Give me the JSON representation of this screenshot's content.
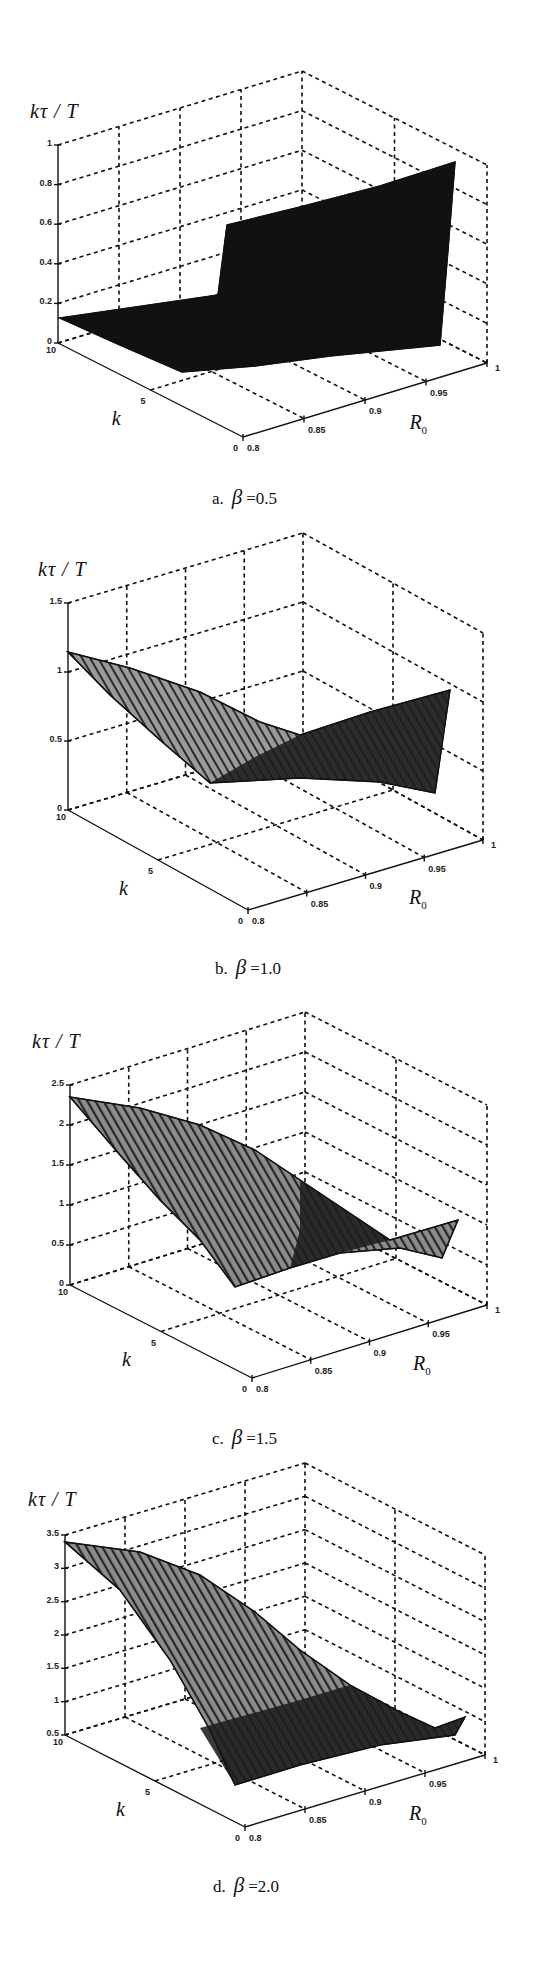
{
  "figure": {
    "panels": [
      {
        "id": "a",
        "caption_prefix": "a.",
        "beta_symbol": "β",
        "caption_value": "=0.5"
      },
      {
        "id": "b",
        "caption_prefix": "b.",
        "beta_symbol": "β",
        "caption_value": "=1.0"
      },
      {
        "id": "c",
        "caption_prefix": "c.",
        "beta_symbol": "β",
        "caption_value": "=1.5"
      },
      {
        "id": "d",
        "caption_prefix": "d.",
        "beta_symbol": "β",
        "caption_value": "=2.0"
      }
    ],
    "zlabel": "kτ / T",
    "klabel": "k",
    "r0label_main": "R",
    "r0label_sub": "0"
  },
  "chart_data": [
    {
      "type": "surface3d",
      "title": "a. β =0.5",
      "zlabel": "kτ/T",
      "xlabel": "R0",
      "ylabel": "k",
      "x_ticks": [
        "0.8",
        "0.85",
        "0.9",
        "0.95",
        "1"
      ],
      "y_ticks": [
        "0",
        "5",
        "10"
      ],
      "z_ticks": [
        "0",
        "0.2",
        "0.4",
        "0.6",
        "0.8",
        "1"
      ],
      "xlim": [
        0.8,
        1
      ],
      "ylim": [
        0,
        10
      ],
      "zlim": [
        0,
        1
      ],
      "grid": true,
      "surface_description": "Flat low region (~0.1) for R0 < 0.9, sharp step up at R0≈0.9 to ~0.6, rising to ~0.95 at R0=1",
      "z_range_observed": [
        0,
        0.95
      ],
      "color": "#111111",
      "screen": {
        "origin": [
          58,
          343
        ],
        "kvec": [
          185,
          94
        ],
        "rvec": [
          244,
          -74
        ],
        "zh": 198,
        "zlabel_pos": [
          30,
          100
        ],
        "caption_pos": [
          212,
          485
        ],
        "surface": [
          [
            [
              60,
              318
            ],
            [
              218,
              295
            ],
            [
              227,
              225
            ],
            [
              300,
              207
            ],
            [
              380,
              186
            ],
            [
              455,
              162
            ],
            [
              448,
              250
            ],
            [
              440,
              345
            ],
            [
              330,
              356
            ],
            [
              255,
              366
            ],
            [
              182,
              372
            ],
            [
              120,
              345
            ]
          ]
        ],
        "stripes": []
      }
    },
    {
      "type": "surface3d",
      "title": "b. β =1.0",
      "zlabel": "kτ/T",
      "xlabel": "R0",
      "ylabel": "k",
      "x_ticks": [
        "0.8",
        "0.85",
        "0.9",
        "0.95",
        "1"
      ],
      "y_ticks": [
        "0",
        "5",
        "10"
      ],
      "z_ticks": [
        "0",
        "0.5",
        "1",
        "1.5"
      ],
      "xlim": [
        0.8,
        1
      ],
      "ylim": [
        0,
        10
      ],
      "zlim": [
        0,
        1.5
      ],
      "grid": true,
      "surface_description": "Max ~1.15 at k=10, R0=0.8; decreases toward a valley near R0≈0.9; rises again to ~0.9 at R0=1",
      "z_range_observed": [
        0.2,
        1.15
      ],
      "color": "#3a3a3a",
      "screen": {
        "origin": [
          68,
          810
        ],
        "kvec": [
          180,
          100
        ],
        "rvec": [
          235,
          -70
        ],
        "zh": 207,
        "zlabel_pos": [
          38,
          558
        ],
        "caption_pos": [
          215,
          955
        ],
        "surface": [
          [
            [
              68,
              652
            ],
            [
              130,
              668
            ],
            [
              200,
              692
            ],
            [
              260,
              722
            ],
            [
              300,
              735
            ],
            [
              370,
              712
            ],
            [
              450,
              690
            ],
            [
              442,
              745
            ],
            [
              435,
              793
            ],
            [
              380,
              782
            ],
            [
              300,
              778
            ],
            [
              210,
              783
            ],
            [
              160,
              740
            ],
            [
              110,
              695
            ]
          ]
        ],
        "dark_region": [
          [
            [
              210,
              783
            ],
            [
              255,
              757
            ],
            [
              300,
              735
            ],
            [
              370,
              712
            ],
            [
              450,
              690
            ],
            [
              442,
              745
            ],
            [
              435,
              793
            ],
            [
              380,
              782
            ],
            [
              300,
              778
            ]
          ]
        ],
        "stripes": "light"
      }
    },
    {
      "type": "surface3d",
      "title": "c. β =1.5",
      "zlabel": "kτ/T",
      "xlabel": "R0",
      "ylabel": "k",
      "x_ticks": [
        "0.8",
        "0.85",
        "0.9",
        "0.95",
        "1"
      ],
      "y_ticks": [
        "0",
        "5",
        "10"
      ],
      "z_ticks": [
        "0",
        "0.5",
        "1",
        "1.5",
        "2",
        "2.5"
      ],
      "xlim": [
        0.8,
        1
      ],
      "ylim": [
        0,
        10
      ],
      "zlim": [
        0,
        2.5
      ],
      "grid": true,
      "surface_description": "Max ~2.35 at k=10, R0=0.8; smooth decrease with R0 to a valley near R0≈0.93; small rise to ~0.6 at R0=1",
      "z_range_observed": [
        0.1,
        2.35
      ],
      "color": "#555555",
      "screen": {
        "origin": [
          70,
          1285
        ],
        "kvec": [
          182,
          93
        ],
        "rvec": [
          235,
          -73
        ],
        "zh": 200,
        "zlabel_pos": [
          32,
          1030
        ],
        "caption_pos": [
          212,
          1425
        ],
        "surface": [
          [
            [
              70,
              1097
            ],
            [
              140,
              1108
            ],
            [
              200,
              1125
            ],
            [
              255,
              1150
            ],
            [
              300,
              1180
            ],
            [
              345,
              1210
            ],
            [
              390,
              1240
            ],
            [
              458,
              1220
            ],
            [
              442,
              1258
            ],
            [
              400,
              1248
            ],
            [
              340,
              1253
            ],
            [
              290,
              1268
            ],
            [
              235,
              1287
            ],
            [
              200,
              1240
            ],
            [
              160,
              1200
            ],
            [
              120,
              1155
            ]
          ]
        ],
        "dark_region": [
          [
            [
              300,
              1180
            ],
            [
              345,
              1210
            ],
            [
              390,
              1240
            ],
            [
              340,
              1253
            ],
            [
              290,
              1268
            ],
            [
              300,
              1230
            ]
          ]
        ],
        "stripes": "mid"
      }
    },
    {
      "type": "surface3d",
      "title": "d. β =2.0",
      "zlabel": "kτ/T",
      "xlabel": "R0",
      "ylabel": "k",
      "x_ticks": [
        "0.8",
        "0.85",
        "0.9",
        "0.95",
        "1"
      ],
      "y_ticks": [
        "0",
        "5",
        "10"
      ],
      "z_ticks": [
        "0.5",
        "1",
        "1.5",
        "2",
        "2.5",
        "3",
        "3.5"
      ],
      "xlim": [
        0.8,
        1
      ],
      "ylim": [
        0,
        10
      ],
      "zlim": [
        0.5,
        3.5
      ],
      "grid": true,
      "surface_description": "Max ~3.4 at k=10, R0=0.8; decreases smoothly with R0 to ~0.7 near R0≈0.95; slight rise at R0=1",
      "z_range_observed": [
        0.6,
        3.4
      ],
      "color": "#444444",
      "screen": {
        "origin": [
          65,
          1735
        ],
        "kvec": [
          180,
          92
        ],
        "rvec": [
          240,
          -72
        ],
        "zh": 200,
        "zlabel_pos": [
          28,
          1488
        ],
        "caption_pos": [
          213,
          1873
        ],
        "surface": [
          [
            [
              65,
              1542
            ],
            [
              140,
              1552
            ],
            [
              200,
              1575
            ],
            [
              255,
              1612
            ],
            [
              300,
              1650
            ],
            [
              350,
              1685
            ],
            [
              400,
              1712
            ],
            [
              435,
              1728
            ],
            [
              465,
              1717
            ],
            [
              455,
              1735
            ],
            [
              380,
              1745
            ],
            [
              300,
              1765
            ],
            [
              235,
              1785
            ],
            [
              210,
              1730
            ],
            [
              170,
              1660
            ],
            [
              120,
              1590
            ]
          ]
        ],
        "dark_region": [
          [
            [
              200,
              1728
            ],
            [
              300,
              1700
            ],
            [
              350,
              1685
            ],
            [
              400,
              1712
            ],
            [
              435,
              1728
            ],
            [
              465,
              1717
            ],
            [
              455,
              1735
            ],
            [
              380,
              1745
            ],
            [
              300,
              1765
            ],
            [
              235,
              1785
            ]
          ]
        ],
        "stripes": "mid"
      }
    }
  ]
}
